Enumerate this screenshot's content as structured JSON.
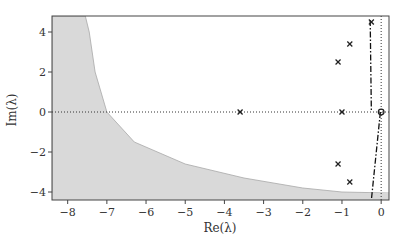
{
  "chart_data": {
    "type": "scatter",
    "title": "",
    "xlabel": "Re(λ)",
    "ylabel": "Im(λ)",
    "xlim": [
      -8.4,
      0.2
    ],
    "ylim": [
      -4.4,
      4.8
    ],
    "xticks": [
      -8,
      -7,
      -6,
      -5,
      -4,
      -3,
      -2,
      -1,
      0
    ],
    "xtick_labels": [
      "−8",
      "−7",
      "−6",
      "−5",
      "−4",
      "−3",
      "−2",
      "−1",
      "0"
    ],
    "yticks": [
      -4,
      -2,
      0,
      2,
      4
    ],
    "ytick_labels": [
      "−4",
      "−2",
      "0",
      "2",
      "4"
    ],
    "grid": false,
    "legend": null,
    "series": [
      {
        "name": "eigenvalues",
        "marker": "x",
        "color": "#222222",
        "points": [
          {
            "x": -3.6,
            "y": 0.0
          },
          {
            "x": -1.0,
            "y": 0.0
          },
          {
            "x": -1.1,
            "y": 2.5
          },
          {
            "x": -1.1,
            "y": -2.6
          },
          {
            "x": -0.8,
            "y": 3.4
          },
          {
            "x": -0.8,
            "y": -3.5
          },
          {
            "x": -0.25,
            "y": 4.5
          }
        ]
      },
      {
        "name": "origin",
        "marker": "o",
        "color": "#222222",
        "points": [
          {
            "x": 0.0,
            "y": 0.0
          }
        ]
      }
    ],
    "shaded_region": {
      "description": "gray region left of a hyperbola-like boundary, plus band below Im = -4.2",
      "color": "#d9d9d9",
      "boundary": [
        {
          "x": -7.55,
          "y": 4.8
        },
        {
          "x": -7.45,
          "y": 4.0
        },
        {
          "x": -7.3,
          "y": 2.0
        },
        {
          "x": -7.0,
          "y": 0.0
        },
        {
          "x": -6.3,
          "y": -1.5
        },
        {
          "x": -5.0,
          "y": -2.6
        },
        {
          "x": -3.5,
          "y": -3.3
        },
        {
          "x": -2.0,
          "y": -3.8
        },
        {
          "x": -1.0,
          "y": -4.0
        },
        {
          "x": 0.2,
          "y": -4.05
        }
      ]
    },
    "reference_lines": [
      {
        "orientation": "horizontal",
        "y": 0,
        "style": "dotted"
      },
      {
        "orientation": "vertical",
        "x": 0,
        "style": "dotted"
      },
      {
        "style": "dash-dot",
        "from": {
          "x": -0.28,
          "y": 4.6
        },
        "to": {
          "x": -0.25,
          "y": 0.0
        }
      },
      {
        "style": "dash-dot",
        "from": {
          "x": -0.02,
          "y": 0.0
        },
        "to": {
          "x": -0.25,
          "y": -4.4
        }
      }
    ]
  }
}
